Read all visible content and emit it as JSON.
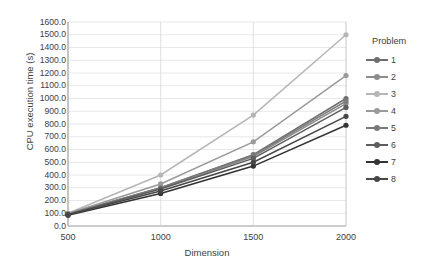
{
  "chart_data": {
    "type": "line",
    "title": "",
    "xlabel": "Dimension",
    "ylabel": "CPU execution time (s)",
    "x": [
      500,
      1000,
      1500,
      2000
    ],
    "xtick_labels": [
      "500",
      "1000",
      "1500",
      "2000"
    ],
    "ytick_labels": [
      "0.0",
      "100.0",
      "200.0",
      "300.0",
      "400.0",
      "500.0",
      "600.0",
      "700.0",
      "800.0",
      "900.0",
      "1000.0",
      "1100.0",
      "1200.0",
      "1300.0",
      "1400.0",
      "1500.0",
      "1600.0"
    ],
    "ylim": [
      0,
      1600
    ],
    "ytick_step": 100,
    "xlim": [
      500,
      2000
    ],
    "grid": true,
    "legend_title": "Problem",
    "legend_position": "right",
    "series": [
      {
        "name": "1",
        "values": [
          95,
          300,
          560,
          1000
        ],
        "color": "#6e6e6e"
      },
      {
        "name": "2",
        "values": [
          92,
          295,
          545,
          960
        ],
        "color": "#8c8c8c"
      },
      {
        "name": "3",
        "values": [
          100,
          400,
          870,
          1500
        ],
        "color": "#b6b6b6"
      },
      {
        "name": "4",
        "values": [
          98,
          330,
          660,
          1180
        ],
        "color": "#9a9a9a"
      },
      {
        "name": "5",
        "values": [
          94,
          300,
          555,
          980
        ],
        "color": "#7a7a7a"
      },
      {
        "name": "6",
        "values": [
          90,
          290,
          530,
          930
        ],
        "color": "#5d5d5d"
      },
      {
        "name": "7",
        "values": [
          85,
          255,
          470,
          790
        ],
        "color": "#333333"
      },
      {
        "name": "8",
        "values": [
          88,
          275,
          500,
          860
        ],
        "color": "#474747"
      }
    ]
  },
  "legend": {
    "title": "Problem",
    "items": [
      {
        "label": "1"
      },
      {
        "label": "2"
      },
      {
        "label": "3"
      },
      {
        "label": "4"
      },
      {
        "label": "5"
      },
      {
        "label": "6"
      },
      {
        "label": "7"
      },
      {
        "label": "8"
      }
    ]
  },
  "axes": {
    "y_title": "CPU execution time (s)",
    "x_title": "Dimension"
  }
}
